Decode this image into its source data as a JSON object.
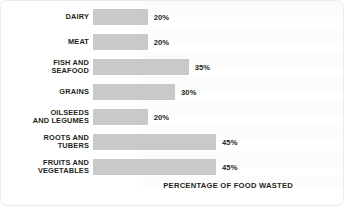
{
  "chart_data": {
    "type": "bar",
    "orientation": "horizontal",
    "title": "",
    "subtitle": "",
    "xlabel": "PERCENTAGE OF FOOD WASTED",
    "ylabel": "",
    "xlim": [
      0,
      84
    ],
    "grid": false,
    "legend": null,
    "bar_color": "#c9c9c9",
    "text_color": "#231f20",
    "categories": [
      "DAIRY",
      "MEAT",
      "FISH AND SEAFOOD",
      "GRAINS",
      "OILSEEDS AND LEGUMES",
      "ROOTS AND TUBERS",
      "FRUITS AND VEGETABLES"
    ],
    "values": [
      20,
      20,
      35,
      30,
      20,
      45,
      45
    ],
    "value_labels": [
      "20%",
      "20%",
      "35%",
      "30%",
      "20%",
      "45%",
      "45%"
    ]
  },
  "chart": {
    "axis_caption": "PERCENTAGE OF FOOD WASTED",
    "rows": [
      {
        "label_line1": "DAIRY",
        "label_line2": "",
        "value": 20,
        "value_label": "20%"
      },
      {
        "label_line1": "MEAT",
        "label_line2": "",
        "value": 20,
        "value_label": "20%"
      },
      {
        "label_line1": "FISH AND",
        "label_line2": "SEAFOOD",
        "value": 35,
        "value_label": "35%"
      },
      {
        "label_line1": "GRAINS",
        "label_line2": "",
        "value": 30,
        "value_label": "30%"
      },
      {
        "label_line1": "OILSEEDS",
        "label_line2": "AND LEGUMES",
        "value": 20,
        "value_label": "20%"
      },
      {
        "label_line1": "ROOTS AND",
        "label_line2": "TUBERS",
        "value": 45,
        "value_label": "45%"
      },
      {
        "label_line1": "FRUITS AND",
        "label_line2": "VEGETABLES",
        "value": 45,
        "value_label": "45%"
      }
    ]
  }
}
